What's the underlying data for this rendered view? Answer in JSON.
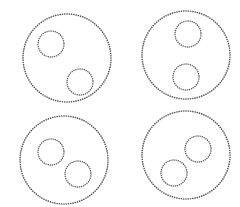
{
  "diagram": {
    "title": "",
    "stroke_color": "#555555",
    "background_color": "#ffffff",
    "panels": [
      {
        "name": "panel-top-left",
        "arrangement": "diagonal-separated",
        "inner_count": 2
      },
      {
        "name": "panel-top-right",
        "arrangement": "vertical-separated",
        "inner_count": 2
      },
      {
        "name": "panel-bottom-left",
        "arrangement": "diagonal-near",
        "inner_count": 2
      },
      {
        "name": "panel-bottom-right",
        "arrangement": "diagonal-near-reversed",
        "inner_count": 2
      }
    ]
  }
}
